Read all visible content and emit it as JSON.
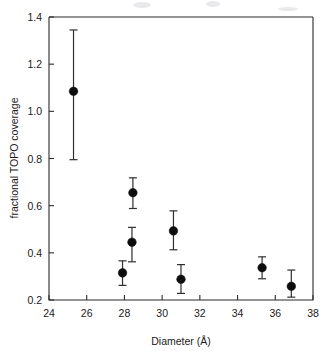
{
  "chart_data": {
    "type": "scatter",
    "title": "",
    "subtitle": "",
    "xlabel": "Diameter (Å)",
    "ylabel": "fractional TOPO coverage",
    "xlim": [
      24,
      38
    ],
    "ylim": [
      0.2,
      1.4
    ],
    "xticks": [
      24,
      26,
      28,
      30,
      32,
      34,
      36,
      38
    ],
    "xtick_labels": [
      "24",
      "26",
      "28",
      "30",
      "32",
      "34",
      "36",
      "38"
    ],
    "yticks": [
      0.2,
      0.4,
      0.6,
      0.8,
      1.0,
      1.2,
      1.4
    ],
    "ytick_labels": [
      "0.2",
      "0.4",
      "0.6",
      "0.8",
      "1.0",
      "1.2",
      "1.4"
    ],
    "grid": false,
    "legend": false,
    "legend_position": "none",
    "marker_style": "filled-circle",
    "marker_color": "#0d0d0d",
    "errorbar_color": "#2f2f2f",
    "axis_color": "#2b2b2b",
    "background_color": "#ffffff",
    "series": [
      {
        "name": "fractional TOPO coverage",
        "points": [
          {
            "x": 25.3,
            "y": 1.085,
            "yerr_low": 0.795,
            "yerr_high": 1.345
          },
          {
            "x": 27.9,
            "y": 0.315,
            "yerr_low": 0.262,
            "yerr_high": 0.366
          },
          {
            "x": 28.4,
            "y": 0.445,
            "yerr_low": 0.362,
            "yerr_high": 0.508
          },
          {
            "x": 28.45,
            "y": 0.655,
            "yerr_low": 0.588,
            "yerr_high": 0.718
          },
          {
            "x": 30.6,
            "y": 0.493,
            "yerr_low": 0.413,
            "yerr_high": 0.578
          },
          {
            "x": 31.0,
            "y": 0.288,
            "yerr_low": 0.228,
            "yerr_high": 0.35
          },
          {
            "x": 35.3,
            "y": 0.337,
            "yerr_low": 0.29,
            "yerr_high": 0.383
          },
          {
            "x": 36.85,
            "y": 0.258,
            "yerr_low": 0.212,
            "yerr_high": 0.327
          }
        ]
      }
    ]
  }
}
